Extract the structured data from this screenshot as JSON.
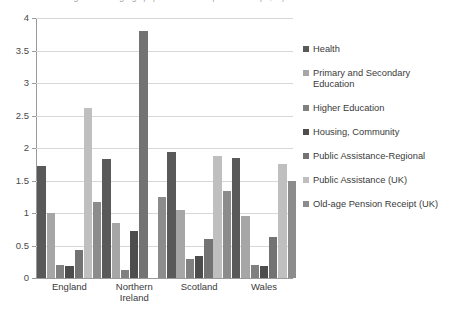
{
  "chart_data": {
    "type": "bar",
    "title": "Percentage of working-age population in receipt of benefit (%, %)",
    "xlabel": "",
    "ylabel": "",
    "ylim": [
      0,
      4
    ],
    "ytick_labels": [
      "0",
      "0.5",
      "1",
      "1.5",
      "2",
      "2.5",
      "3",
      "3.5",
      "4"
    ],
    "ytick_values": [
      0,
      0.5,
      1,
      1.5,
      2,
      2.5,
      3,
      3.5,
      4
    ],
    "grid": true,
    "legend_position": "right",
    "categories": [
      "England",
      "Northern Ireland",
      "Scotland",
      "Wales"
    ],
    "series": [
      {
        "name": "Health",
        "color": "#595959",
        "values": [
          1.72,
          1.83,
          1.94,
          1.85
        ]
      },
      {
        "name": "Primary and Secondary Education",
        "color": "#a6a6a6",
        "values": [
          1.0,
          0.85,
          1.05,
          0.96
        ]
      },
      {
        "name": "Higher Education",
        "color": "#808080",
        "values": [
          0.2,
          0.12,
          0.3,
          0.2
        ]
      },
      {
        "name": "Housing, Community",
        "color": "#4d4d4d",
        "values": [
          0.18,
          0.72,
          0.34,
          0.19
        ]
      },
      {
        "name": "Public Assistance-Regional",
        "color": "#737373",
        "values": [
          0.43,
          3.8,
          0.6,
          0.63
        ]
      },
      {
        "name": "Public Assistance  (UK)",
        "color": "#bfbfbf",
        "values": [
          2.62,
          0.0,
          1.87,
          1.75
        ]
      },
      {
        "name": "Old-age Pension Receipt (UK)",
        "color": "#8c8c8c",
        "values": [
          1.17,
          1.25,
          1.34,
          1.49
        ]
      }
    ]
  },
  "legend": {
    "items": [
      {
        "label": "Health"
      },
      {
        "label": "Primary and Secondary Education"
      },
      {
        "label": "Higher Education"
      },
      {
        "label": "Housing, Community"
      },
      {
        "label": "Public Assistance-Regional"
      },
      {
        "label": "Public Assistance  (UK)"
      },
      {
        "label": "Old-age Pension Receipt (UK)"
      }
    ]
  }
}
